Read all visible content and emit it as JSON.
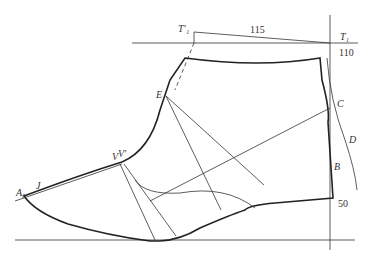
{
  "diagram": {
    "type": "shoe-upper-pattern",
    "labels": {
      "T1prime": "T′₁",
      "T1": "T₁",
      "E": "E",
      "C": "C",
      "D": "D",
      "B": "B",
      "A0": "A₀",
      "J": "J",
      "V": "V",
      "Vprime": "V′"
    },
    "dimensions": {
      "top": "115",
      "right_top": "110",
      "right_bottom": "50"
    },
    "colors": {
      "line": "#222222",
      "background": "#ffffff"
    }
  }
}
